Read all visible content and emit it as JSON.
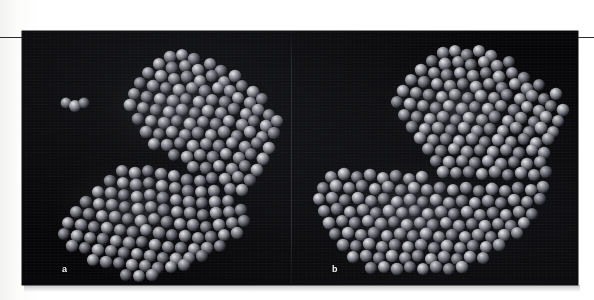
{
  "figure": {
    "kind": "scanned-journal-figure",
    "panel_count": 2,
    "background_color": "#060608",
    "page_color": "#ffffff",
    "rule_color": "#2b2b2b",
    "panels": [
      {
        "id": "a",
        "label": "a",
        "label_color": "#f3f3f3",
        "content": "space-filling-molecular-model",
        "description": "grey space-filling (CPK) protein model with two lobes separated by a cleft and a small detached cluster of three spheres at the upper left",
        "sphere_color_light": "#c9c9cd",
        "sphere_color_mid": "#8a8a90",
        "sphere_color_dark": "#2e2e34",
        "detached_cluster_spheres": 3
      },
      {
        "id": "b",
        "label": "b",
        "label_color": "#f3f3f3",
        "content": "space-filling-molecular-model",
        "description": "grey space-filling (CPK) protein model of the same molecule in a closed, continuous conformation with the cleft filled in",
        "sphere_color_light": "#c9c9cd",
        "sphere_color_mid": "#8a8a90",
        "sphere_color_dark": "#2e2e34",
        "detached_cluster_spheres": 0
      }
    ]
  }
}
